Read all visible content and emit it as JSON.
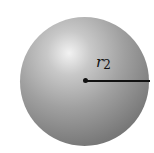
{
  "figure": {
    "shape": "sphere",
    "radius_label": {
      "symbol": "r",
      "subscript": "2"
    },
    "colors": {
      "highlight": "#f2f2f2",
      "edge": "#5e5e5e",
      "line": "#111111"
    }
  }
}
